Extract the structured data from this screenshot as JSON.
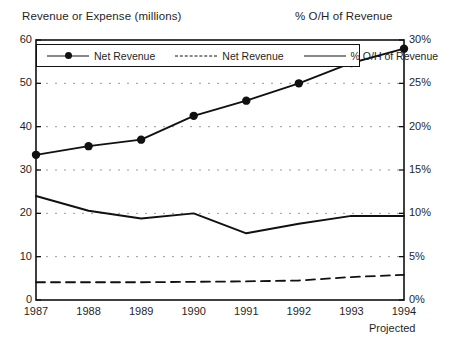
{
  "titles": {
    "left_axis_title": "Revenue or Expense (millions)",
    "right_axis_title": "% O/H of Revenue",
    "footnote": "Projected"
  },
  "legend": {
    "items": [
      {
        "label": "Net Revenue",
        "style": "solid-with-markers",
        "icon": "line-marker-icon"
      },
      {
        "label": "Net Revenue",
        "style": "dashed",
        "icon": "dashed-line-icon"
      },
      {
        "label": "% O/H of Revenue",
        "style": "solid",
        "icon": "solid-line-icon"
      }
    ]
  },
  "chart_data": {
    "type": "line",
    "title": "",
    "xlabel": "",
    "ylabel": "Revenue or Expense (millions)",
    "y2label": "% O/H of Revenue",
    "categories": [
      "1987",
      "1988",
      "1989",
      "1990",
      "1991",
      "1992",
      "1993",
      "1994"
    ],
    "x_tick_labels": [
      "1987",
      "1988",
      "1989",
      "1990",
      "1991",
      "1992",
      "1993",
      "1994"
    ],
    "y_tick_labels": [
      "0",
      "10",
      "20",
      "30",
      "40",
      "50",
      "60"
    ],
    "y_ticks": [
      0,
      10,
      20,
      30,
      40,
      50,
      60
    ],
    "ylim": [
      0,
      60
    ],
    "y2_tick_labels": [
      "0%",
      "5%",
      "10%",
      "15%",
      "20%",
      "25%",
      "30%"
    ],
    "y2_ticks": [
      0,
      5,
      10,
      15,
      20,
      25,
      30
    ],
    "y2lim": [
      0,
      30
    ],
    "grid": true,
    "grid_style": "dotted-horizontal",
    "legend_position": "top-inside",
    "series": [
      {
        "name": "Net Revenue",
        "axis": "left",
        "style": "solid-with-markers",
        "color": "#111111",
        "values": [
          33.5,
          35.5,
          37.0,
          42.5,
          46.0,
          50.0,
          54.7,
          58.0
        ]
      },
      {
        "name": "Net Revenue",
        "axis": "left",
        "style": "dashed",
        "color": "#111111",
        "values": [
          4.1,
          4.1,
          4.1,
          4.2,
          4.3,
          4.5,
          5.3,
          5.8
        ]
      },
      {
        "name": "% O/H of Revenue",
        "axis": "right",
        "style": "solid",
        "color": "#111111",
        "values": [
          12.0,
          10.3,
          9.4,
          10.0,
          7.7,
          8.8,
          9.7,
          9.7
        ]
      }
    ],
    "annotations": [
      {
        "text": "Projected",
        "x": "1994",
        "position": "below-axis"
      }
    ]
  }
}
